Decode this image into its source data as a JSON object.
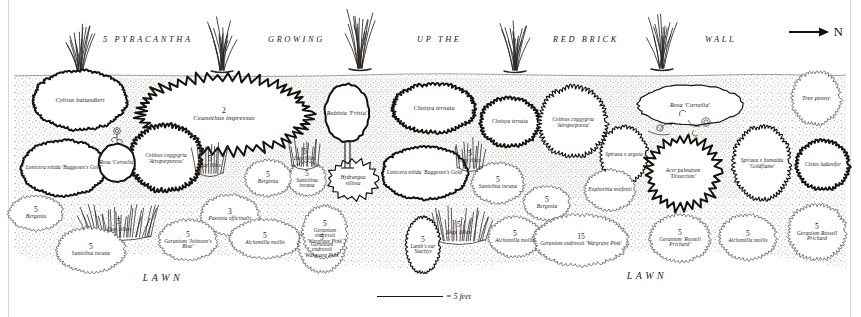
{
  "plan": {
    "title_banner": "5 PYRACANTHA   GROWING   UP THE   RED BRICK   WALL",
    "banner_words": [
      {
        "text": "5 PYRACANTHA",
        "x": 103
      },
      {
        "text": "GROWING",
        "x": 268
      },
      {
        "text": "UP THE",
        "x": 417
      },
      {
        "text": "RED BRICK",
        "x": 553
      },
      {
        "text": "WALL",
        "x": 705
      }
    ],
    "north_label": "N",
    "scale_label": "= 5 feet",
    "lawn_labels": [
      {
        "text": "LAWN",
        "x": 163,
        "y": 277
      },
      {
        "text": "LAWN",
        "x": 647,
        "y": 275
      }
    ],
    "colors": {
      "ink": "#1a1a1a",
      "paper": "#ffffff",
      "stipple": "#9a958e",
      "border": "#d8d8d8",
      "faint_ink": "#6f6a64"
    },
    "plants": [
      {
        "name": "Cytisus battandieri",
        "count": "",
        "x": 80,
        "y": 100,
        "rx": 46,
        "ry": 29,
        "edge": "bumpy",
        "weight": "heavy",
        "size": "s6"
      },
      {
        "name": "Ceanothus impressus",
        "count": "2",
        "x": 224,
        "y": 114,
        "rx": 80,
        "ry": 34,
        "edge": "spiky",
        "weight": "heavy",
        "size": "s7"
      },
      {
        "name": "Cotinus coggygria 'Atropurpureus'",
        "count": "",
        "x": 166,
        "y": 158,
        "rx": 34,
        "ry": 31,
        "edge": "scallop",
        "weight": "heavy",
        "size": "s5"
      },
      {
        "name": "Lonicera nitida 'Baggesen's Gold'",
        "count": "",
        "x": 64,
        "y": 168,
        "rx": 42,
        "ry": 27,
        "edge": "bumpy",
        "weight": "heavy",
        "size": "s5"
      },
      {
        "name": "Rosa 'Cornelia'",
        "count": "",
        "x": 117,
        "y": 163,
        "rx": 18,
        "ry": 19,
        "edge": "smooth",
        "weight": "heavy",
        "size": "s5"
      },
      {
        "name": "Robinia 'Frisia'",
        "count": "",
        "x": 347,
        "y": 113,
        "rx": 22,
        "ry": 29,
        "edge": "smooth",
        "weight": "heavy",
        "size": "s6"
      },
      {
        "name": "Choisya ternata",
        "count": "",
        "x": 434,
        "y": 108,
        "rx": 40,
        "ry": 23,
        "edge": "scallop",
        "weight": "heavy",
        "size": "s6"
      },
      {
        "name": "Choisya ternata",
        "count": "",
        "x": 510,
        "y": 122,
        "rx": 28,
        "ry": 23,
        "edge": "scallop",
        "weight": "heavy",
        "size": "s5"
      },
      {
        "name": "Lonicera nitida 'Baggesen's Gold'",
        "count": "",
        "x": 425,
        "y": 173,
        "rx": 42,
        "ry": 26,
        "edge": "bumpy",
        "weight": "heavy",
        "size": "s5"
      },
      {
        "name": "Hydrangea villosa",
        "count": "",
        "x": 353,
        "y": 180,
        "rx": 22,
        "ry": 17,
        "edge": "spiky",
        "weight": "medium",
        "size": "s5"
      },
      {
        "name": "Santolina incana",
        "count": "5",
        "x": 307,
        "y": 179,
        "rx": 18,
        "ry": 16,
        "edge": "scallop",
        "weight": "light",
        "size": "s5"
      },
      {
        "name": "Santolina incana",
        "count": "5",
        "x": 498,
        "y": 183,
        "rx": 25,
        "ry": 19,
        "edge": "scallop",
        "weight": "light",
        "size": "s5"
      },
      {
        "name": "Cotinus coggygria 'Atropurpurea'",
        "count": "",
        "x": 573,
        "y": 122,
        "rx": 32,
        "ry": 33,
        "edge": "scallop",
        "weight": "medium",
        "size": "s5"
      },
      {
        "name": "Rosa 'Cornelia'",
        "count": "",
        "x": 690,
        "y": 105,
        "rx": 52,
        "ry": 20,
        "edge": "smooth",
        "weight": "medium",
        "size": "s6"
      },
      {
        "name": "Tree peony",
        "count": "",
        "x": 816,
        "y": 98,
        "rx": 23,
        "ry": 25,
        "edge": "scallop",
        "weight": "light",
        "size": "s6"
      },
      {
        "name": "Spiraea x arguta",
        "count": "",
        "x": 624,
        "y": 155,
        "rx": 22,
        "ry": 27,
        "edge": "scallop",
        "weight": "medium",
        "size": "s5"
      },
      {
        "name": "Acer palmatum 'Dissectum'",
        "count": "",
        "x": 683,
        "y": 173,
        "rx": 32,
        "ry": 31,
        "edge": "spiky",
        "weight": "heavy",
        "size": "s5"
      },
      {
        "name": "Spiraea x bumalda 'Goldflame'",
        "count": "",
        "x": 762,
        "y": 163,
        "rx": 27,
        "ry": 35,
        "edge": "scallop",
        "weight": "medium",
        "size": "s5"
      },
      {
        "name": "Euphorbia wulfenii",
        "count": "",
        "x": 610,
        "y": 190,
        "rx": 24,
        "ry": 19,
        "edge": "scallop",
        "weight": "light",
        "size": "s5"
      },
      {
        "name": "Cistus ladanifer",
        "count": "",
        "x": 823,
        "y": 165,
        "rx": 25,
        "ry": 23,
        "edge": "scallop",
        "weight": "heavy",
        "size": "s5"
      },
      {
        "name": "Bergenia",
        "count": "5",
        "x": 268,
        "y": 178,
        "rx": 22,
        "ry": 17,
        "edge": "scallop",
        "weight": "light",
        "size": "s5"
      },
      {
        "name": "Bergenia",
        "count": "5",
        "x": 547,
        "y": 203,
        "rx": 22,
        "ry": 16,
        "edge": "scallop",
        "weight": "light",
        "size": "s5"
      },
      {
        "name": "Paeonia officinalis",
        "count": "3",
        "x": 230,
        "y": 215,
        "rx": 28,
        "ry": 19,
        "edge": "scallop",
        "weight": "light",
        "size": "s5"
      },
      {
        "name": "Day lilies",
        "count": "5",
        "x": 210,
        "y": 162,
        "rx": 13,
        "ry": 15,
        "edge": "grass",
        "weight": "medium",
        "size": "s5"
      },
      {
        "name": "Day lilies",
        "count": "5",
        "x": 305,
        "y": 155,
        "rx": 13,
        "ry": 15,
        "edge": "grass",
        "weight": "medium",
        "size": "s5"
      },
      {
        "name": "Day lilies",
        "count": "5",
        "x": 470,
        "y": 157,
        "rx": 12,
        "ry": 15,
        "edge": "grass",
        "weight": "medium",
        "size": "s5"
      },
      {
        "name": "Day lilies",
        "count": "5",
        "x": 119,
        "y": 225,
        "rx": 32,
        "ry": 16,
        "edge": "grass",
        "weight": "medium",
        "size": "s6"
      },
      {
        "name": "Day lilies",
        "count": "5",
        "x": 459,
        "y": 228,
        "rx": 26,
        "ry": 17,
        "edge": "grass",
        "weight": "medium",
        "size": "s6"
      },
      {
        "name": "Bergenia",
        "count": "5",
        "x": 36,
        "y": 213,
        "rx": 26,
        "ry": 16,
        "edge": "scallop",
        "weight": "light",
        "size": "s5"
      },
      {
        "name": "Santolina incana",
        "count": "5",
        "x": 91,
        "y": 250,
        "rx": 33,
        "ry": 21,
        "edge": "scallop",
        "weight": "light",
        "size": "s5"
      },
      {
        "name": "Geranium 'Johnson's Blue'",
        "count": "5",
        "x": 188,
        "y": 240,
        "rx": 28,
        "ry": 19,
        "edge": "scallop",
        "weight": "light",
        "size": "s5"
      },
      {
        "name": "Alchemilla mollis",
        "count": "5",
        "x": 265,
        "y": 239,
        "rx": 34,
        "ry": 18,
        "edge": "scallop",
        "weight": "light",
        "size": "s5"
      },
      {
        "name": "Geranium endressii 'Wargrave Pink'",
        "count": "5",
        "x": 322,
        "y": 246,
        "rx": 22,
        "ry": 25,
        "edge": "scallop",
        "weight": "light",
        "size": "s5"
      },
      {
        "name": "Geranium endressii 'Wargrave Pink'",
        "count": "5",
        "x": 325,
        "y": 232,
        "rx": 21,
        "ry": 25,
        "edge": "scallop",
        "weight": "light",
        "size": "s5"
      },
      {
        "name": "Lamb's ear Stachys",
        "count": "5",
        "x": 423,
        "y": 245,
        "rx": 16,
        "ry": 27,
        "edge": "scallop",
        "weight": "medium",
        "size": "s5"
      },
      {
        "name": "Alchemilla mollis",
        "count": "5",
        "x": 515,
        "y": 237,
        "rx": 25,
        "ry": 19,
        "edge": "scallop",
        "weight": "light",
        "size": "s5"
      },
      {
        "name": "Geranium endressii 'Wargrave Pink'",
        "count": "15",
        "x": 581,
        "y": 240,
        "rx": 46,
        "ry": 24,
        "edge": "scallop",
        "weight": "light",
        "size": "s5"
      },
      {
        "name": "Geranium 'Russell Prichard'",
        "count": "5",
        "x": 680,
        "y": 238,
        "rx": 29,
        "ry": 22,
        "edge": "scallop",
        "weight": "light",
        "size": "s5"
      },
      {
        "name": "Alchemilla mollis",
        "count": "5",
        "x": 748,
        "y": 237,
        "rx": 27,
        "ry": 21,
        "edge": "scallop",
        "weight": "light",
        "size": "s5"
      },
      {
        "name": "Geranium Russell Prichard",
        "count": "5",
        "x": 817,
        "y": 232,
        "rx": 27,
        "ry": 26,
        "edge": "scallop",
        "weight": "light",
        "size": "s5"
      }
    ],
    "pyracantha_clumps": [
      {
        "x": 80,
        "y": 74,
        "h": 48
      },
      {
        "x": 222,
        "y": 70,
        "h": 52
      },
      {
        "x": 360,
        "y": 68,
        "h": 54
      },
      {
        "x": 515,
        "y": 70,
        "h": 52
      },
      {
        "x": 662,
        "y": 68,
        "h": 50
      }
    ]
  }
}
